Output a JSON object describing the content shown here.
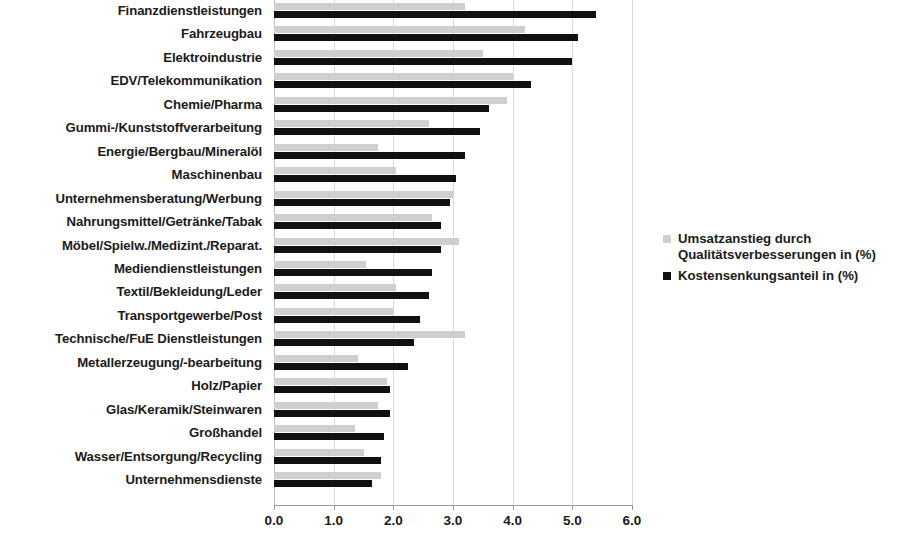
{
  "chart_data": {
    "type": "bar",
    "orientation": "horizontal",
    "title": "",
    "subtitle": "",
    "xlabel": "",
    "ylabel": "",
    "xlim": [
      0.0,
      6.0
    ],
    "xticks": [
      "0.0",
      "1.0",
      "2.0",
      "3.0",
      "4.0",
      "5.0",
      "6.0"
    ],
    "xtick_values": [
      0.0,
      1.0,
      2.0,
      3.0,
      4.0,
      5.0,
      6.0
    ],
    "grid": "vertical",
    "legend_position": "right",
    "categories": [
      "Finanzdienstleistungen",
      "Fahrzeugbau",
      "Elektroindustrie",
      "EDV/Telekommunikation",
      "Chemie/Pharma",
      "Gummi-/Kunststoffverarbeitung",
      "Energie/Bergbau/Mineralöl",
      "Maschinenbau",
      "Unternehmensberatung/Werbung",
      "Nahrungsmittel/Getränke/Tabak",
      "Möbel/Spielw./Medizint./Reparat.",
      "Mediendienstleistungen",
      "Textil/Bekleidung/Leder",
      "Transportgewerbe/Post",
      "Technische/FuE Dienstleistungen",
      "Metallerzeugung/-bearbeitung",
      "Holz/Papier",
      "Glas/Keramik/Steinwaren",
      "Großhandel",
      "Wasser/Entsorgung/Recycling",
      "Unternehmensdienste"
    ],
    "series": [
      {
        "name": "Umsatzanstieg durch Qualitätsverbesserungen in (%)",
        "color": "#cfcfcf",
        "values": [
          3.2,
          4.2,
          3.5,
          4.0,
          3.9,
          2.6,
          1.75,
          2.05,
          3.0,
          2.65,
          3.1,
          1.55,
          2.05,
          2.0,
          3.2,
          1.4,
          1.9,
          1.75,
          1.35,
          1.5,
          1.8
        ]
      },
      {
        "name": "Kostensenkungsanteil in (%)",
        "color": "#111111",
        "values": [
          5.4,
          5.1,
          5.0,
          4.3,
          3.6,
          3.45,
          3.2,
          3.05,
          2.95,
          2.8,
          2.8,
          2.65,
          2.6,
          2.45,
          2.35,
          2.25,
          1.95,
          1.95,
          1.85,
          1.8,
          1.65
        ]
      }
    ]
  },
  "legend": {
    "entries": [
      {
        "label": "Umsatzanstieg durch Qualitätsverbesserungen in (%)",
        "swatch": "quality"
      },
      {
        "label": "Kostensenkungsanteil in (%)",
        "swatch": "cost"
      }
    ]
  }
}
